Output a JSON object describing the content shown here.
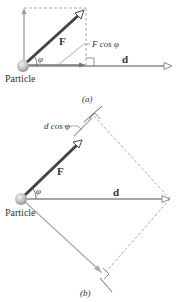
{
  "panel_a": {
    "force_label": "F",
    "angle_label": "φ",
    "projection_label": "F cos φ",
    "displacement_label": "d",
    "particle_label": "Particle",
    "caption": "(a)"
  },
  "panel_b": {
    "force_label": "F",
    "angle_label": "φ",
    "projection_label": "d cos φ",
    "displacement_label": "d",
    "particle_label": "Particle",
    "caption": "(b)"
  },
  "colors": {
    "force": "#444444",
    "displacement": "#8a8a8a",
    "dashed": "#aaaaaa",
    "component": "#999999"
  }
}
